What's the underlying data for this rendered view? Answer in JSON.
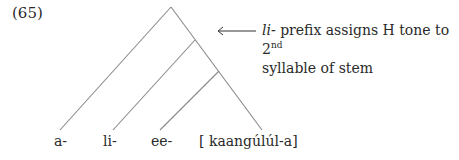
{
  "example_number": "(65)",
  "annotation": {
    "arrow": "←",
    "prefix_italic": "li-",
    "line1_rest": " prefix assigns H tone to 2",
    "superscript": "nd",
    "line2": "syllable of stem"
  },
  "leaves": [
    {
      "label": "a-"
    },
    {
      "label": "li-"
    },
    {
      "label": "ee-"
    },
    {
      "label": "[ kaangúlúl-a]"
    }
  ]
}
